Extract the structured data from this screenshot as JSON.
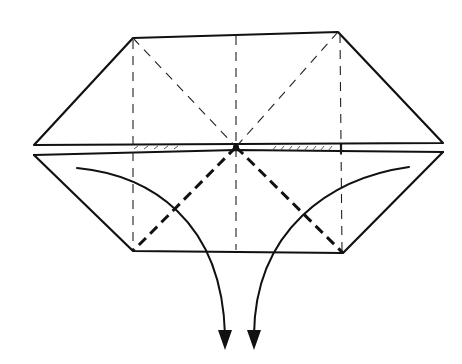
{
  "diagram": {
    "type": "origami-fold-diagram",
    "colors": {
      "line": "#111111",
      "background": "#ffffff"
    },
    "upper_flap": {
      "shape": "trapezoid",
      "points": [
        [
          133,
          38
        ],
        [
          338,
          32
        ],
        [
          443,
          143
        ],
        [
          34,
          145
        ]
      ]
    },
    "lower_flap": {
      "shape": "trapezoid",
      "points": [
        [
          34,
          155
        ],
        [
          443,
          152
        ],
        [
          343,
          253
        ],
        [
          133,
          251
        ]
      ]
    },
    "center_point": [
      236,
      147
    ],
    "crease_lines": {
      "valley_vertical": [
        [
          133,
          38,
          133,
          251
        ],
        [
          236,
          36,
          236,
          251
        ],
        [
          340,
          32,
          343,
          253
        ]
      ],
      "valley_diagonal_upper": [
        [
          133,
          38,
          236,
          147
        ],
        [
          338,
          32,
          236,
          147
        ]
      ],
      "valley_diagonal_lower_bold": [
        [
          236,
          147,
          133,
          251
        ],
        [
          236,
          147,
          343,
          253
        ]
      ]
    },
    "arrows": [
      {
        "name": "left-fold-arrow",
        "from": [
          77,
          168
        ],
        "to": [
          224,
          348
        ],
        "direction": "down"
      },
      {
        "name": "right-fold-arrow",
        "from": [
          409,
          167
        ],
        "to": [
          254,
          348
        ],
        "direction": "down"
      }
    ]
  }
}
